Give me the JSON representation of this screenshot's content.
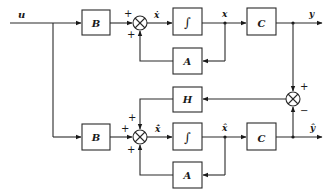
{
  "diagram": {
    "type": "state-observer-block-diagram",
    "input_label": "u",
    "plant": {
      "input_gain": "B",
      "integrator": "∫",
      "state_derivative": "ẋ",
      "state": "x",
      "feedback_gain": "A",
      "output_gain": "C",
      "output": "y",
      "sum_signs": [
        "+",
        "+"
      ]
    },
    "observer": {
      "input_gain": "B",
      "integrator": "∫",
      "state_derivative": "x̂̇",
      "state": "x̂",
      "feedback_gain": "A",
      "output_gain": "C",
      "output": "ŷ",
      "correction_gain": "H",
      "sum_signs": [
        "+",
        "+",
        "+"
      ]
    },
    "error_sum_signs": [
      "+",
      "−"
    ]
  }
}
